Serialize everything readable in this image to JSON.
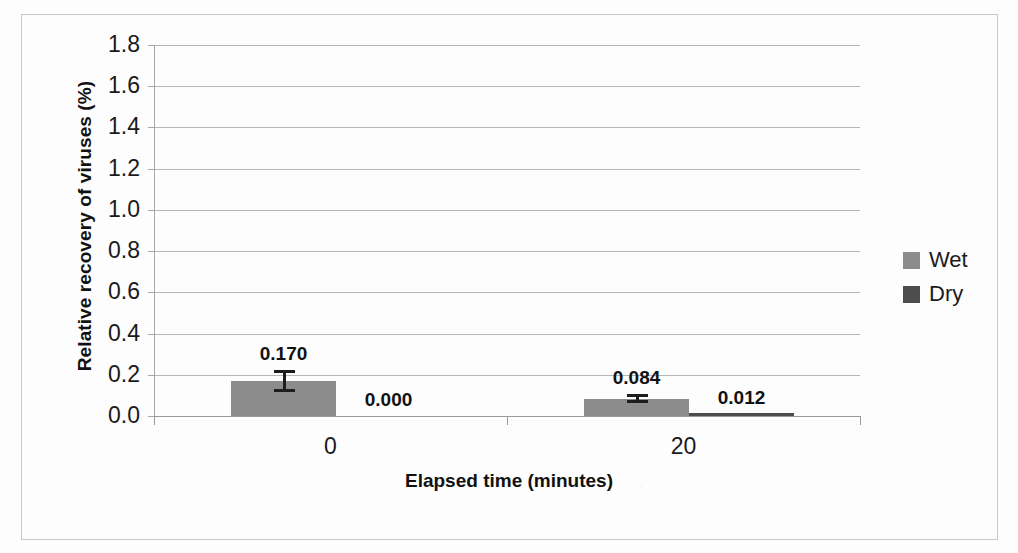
{
  "chart_data": {
    "type": "bar",
    "title": "",
    "xlabel": "Elapsed time (minutes)",
    "ylabel": "Relative recovery of viruses (%)",
    "categories": [
      "0",
      "20"
    ],
    "series": [
      {
        "name": "Wet",
        "color": "#8c8c8c",
        "values": [
          0.17,
          0.084
        ],
        "labels": [
          "0.170",
          "0.084"
        ],
        "errors": [
          0.055,
          0.022
        ]
      },
      {
        "name": "Dry",
        "color": "#4d4d4d",
        "values": [
          0.0,
          0.012
        ],
        "labels": [
          "0.000",
          "0.012"
        ],
        "errors": [
          0.0,
          0.0
        ]
      }
    ],
    "ylim": [
      0.0,
      1.8
    ],
    "ytick_labels": [
      "1.8",
      "1.6",
      "1.4",
      "1.2",
      "1.0",
      "0.8",
      "0.6",
      "0.4",
      "0.2",
      "0.0"
    ],
    "ytick_values": [
      1.8,
      1.6,
      1.4,
      1.2,
      1.0,
      0.8,
      0.6,
      0.4,
      0.2,
      0.0
    ],
    "grid": true,
    "legend_position": "right",
    "legend_entries": [
      "Wet",
      "Dry"
    ]
  },
  "axes": {
    "y_title": "Relative recovery of viruses (%)",
    "x_title": "Elapsed time (minutes)",
    "x_labels": [
      "0",
      "20"
    ]
  },
  "legend": {
    "items": [
      {
        "label": "Wet",
        "color": "#8c8c8c"
      },
      {
        "label": "Dry",
        "color": "#4d4d4d"
      }
    ]
  },
  "bar_labels": {
    "g0_wet": "0.170",
    "g0_dry": "0.000",
    "g1_wet": "0.084",
    "g1_dry": "0.012"
  },
  "y_ticks": [
    "1.8",
    "1.6",
    "1.4",
    "1.2",
    "1.0",
    "0.8",
    "0.6",
    "0.4",
    "0.2",
    "0.0"
  ]
}
